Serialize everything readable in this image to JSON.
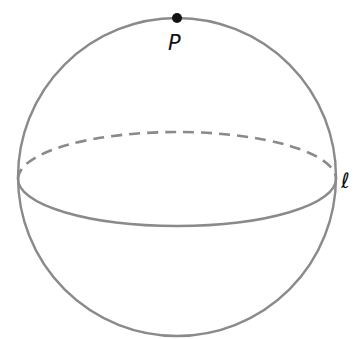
{
  "diagram": {
    "type": "sphere",
    "colors": {
      "stroke": "#8a8a8a",
      "point": "#111111",
      "label": "#111111",
      "background": "#ffffff"
    },
    "point": {
      "label": "P"
    },
    "line": {
      "label": "ℓ"
    }
  }
}
